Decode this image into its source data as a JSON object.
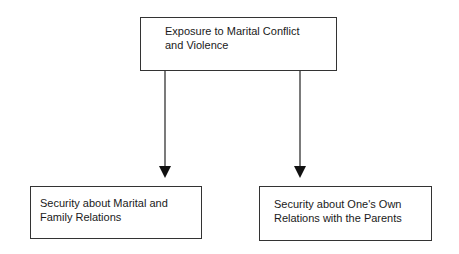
{
  "diagram": {
    "top_node": {
      "lines": [
        "Exposure to Marital Conflict",
        "and Violence"
      ]
    },
    "left_node": {
      "lines": [
        "Security about Marital and",
        "Family Relations"
      ]
    },
    "right_node": {
      "lines": [
        "Security about One's Own",
        "Relations with the Parents"
      ]
    },
    "edges": [
      {
        "from": "top_node",
        "to": "left_node"
      },
      {
        "from": "top_node",
        "to": "right_node"
      }
    ],
    "colors": {
      "line": "#222222",
      "background": "#ffffff"
    }
  }
}
